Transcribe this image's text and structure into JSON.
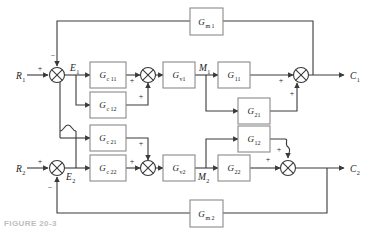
{
  "figure": {
    "type": "block-diagram",
    "caption": "FIGURE 20-3",
    "line_color": "#3a3a3a",
    "block_fill": "#ffffff",
    "block_stroke": "#8a8a8a",
    "text_color": "#1a1a1a",
    "background": "#ffffff"
  },
  "inputs": [
    {
      "name": "R1",
      "base": "R",
      "sub": "1"
    },
    {
      "name": "R2",
      "base": "R",
      "sub": "2"
    }
  ],
  "outputs": [
    {
      "name": "C1",
      "base": "C",
      "sub": "1"
    },
    {
      "name": "C2",
      "base": "C",
      "sub": "2"
    }
  ],
  "signals": [
    {
      "name": "E1",
      "base": "E",
      "sub": "1"
    },
    {
      "name": "E2",
      "base": "E",
      "sub": "2"
    },
    {
      "name": "M1",
      "base": "M",
      "sub": "1"
    },
    {
      "name": "M2",
      "base": "M",
      "sub": "2"
    }
  ],
  "blocks": [
    {
      "id": "Gc11",
      "base": "G",
      "sub": "c 11",
      "x": 90,
      "y": 62,
      "w": 36,
      "h": 26
    },
    {
      "id": "Gc12",
      "base": "G",
      "sub": "c 12",
      "x": 90,
      "y": 92,
      "w": 36,
      "h": 26
    },
    {
      "id": "Gc21",
      "base": "G",
      "sub": "c 21",
      "x": 90,
      "y": 125,
      "w": 36,
      "h": 26
    },
    {
      "id": "Gc22",
      "base": "G",
      "sub": "c 22",
      "x": 90,
      "y": 155,
      "w": 36,
      "h": 26
    },
    {
      "id": "Gv1",
      "base": "G",
      "sub": "v1",
      "x": 163,
      "y": 62,
      "w": 32,
      "h": 26
    },
    {
      "id": "Gv2",
      "base": "G",
      "sub": "v2",
      "x": 163,
      "y": 155,
      "w": 32,
      "h": 26
    },
    {
      "id": "G11",
      "base": "G",
      "sub": "11",
      "x": 218,
      "y": 62,
      "w": 32,
      "h": 26
    },
    {
      "id": "G21",
      "base": "G",
      "sub": "21",
      "x": 238,
      "y": 98,
      "w": 32,
      "h": 26
    },
    {
      "id": "G12",
      "base": "G",
      "sub": "12",
      "x": 238,
      "y": 126,
      "w": 32,
      "h": 26
    },
    {
      "id": "G22",
      "base": "G",
      "sub": "22",
      "x": 218,
      "y": 155,
      "w": 32,
      "h": 26
    },
    {
      "id": "Gm1",
      "base": "G",
      "sub": "m 1",
      "x": 190,
      "y": 8,
      "w": 33,
      "h": 27
    },
    {
      "id": "Gm2",
      "base": "G",
      "sub": "m 2",
      "x": 190,
      "y": 200,
      "w": 33,
      "h": 27
    }
  ],
  "summers": [
    {
      "id": "sum-R1",
      "cx": 57,
      "cy": 75,
      "r": 7.5,
      "signs": [
        {
          "label": "+",
          "x": 40,
          "y": 71
        },
        {
          "label": "−",
          "x": 53,
          "y": 58
        }
      ]
    },
    {
      "id": "sum-M1",
      "cx": 148,
      "cy": 75,
      "r": 7.5,
      "signs": [
        {
          "label": "+",
          "x": 132,
          "y": 83
        },
        {
          "label": "+",
          "x": 141,
          "y": 99
        }
      ]
    },
    {
      "id": "sum-C1",
      "cx": 301,
      "cy": 75,
      "r": 7.5,
      "signs": [
        {
          "label": "+",
          "x": 281,
          "y": 83
        },
        {
          "label": "+",
          "x": 292,
          "y": 96
        }
      ]
    },
    {
      "id": "sum-R2",
      "cx": 57,
      "cy": 168,
      "r": 7.5,
      "signs": [
        {
          "label": "+",
          "x": 40,
          "y": 164
        },
        {
          "label": "−",
          "x": 50,
          "y": 190
        }
      ]
    },
    {
      "id": "sum-M2",
      "cx": 148,
      "cy": 168,
      "r": 7.5,
      "signs": [
        {
          "label": "+",
          "x": 132,
          "y": 164
        },
        {
          "label": "+",
          "x": 141,
          "y": 146
        }
      ]
    },
    {
      "id": "sum-C2",
      "cx": 288,
      "cy": 168,
      "r": 7.5,
      "signs": [
        {
          "label": "+",
          "x": 268,
          "y": 162
        },
        {
          "label": "+",
          "x": 279,
          "y": 152
        }
      ]
    }
  ],
  "labels": {
    "R1": {
      "text": "R",
      "sub": "1",
      "x": 16,
      "y": 79
    },
    "R2": {
      "text": "R",
      "sub": "2",
      "x": 16,
      "y": 172
    },
    "E1": {
      "text": "E",
      "sub": "1",
      "x": 70,
      "y": 71
    },
    "E2": {
      "text": "E",
      "sub": "2",
      "x": 66,
      "y": 180
    },
    "M1": {
      "text": "M",
      "sub": "1",
      "x": 199,
      "y": 71
    },
    "M2": {
      "text": "M",
      "sub": "2",
      "x": 198,
      "y": 180
    },
    "C1": {
      "text": "C",
      "sub": "1",
      "x": 350,
      "y": 79
    },
    "C2": {
      "text": "C",
      "sub": "2",
      "x": 350,
      "y": 172
    }
  }
}
